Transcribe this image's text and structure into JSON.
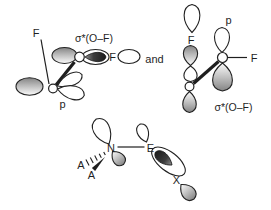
{
  "colors": {
    "background": "#ffffff",
    "ink": "#1f1f1f",
    "lobe_shade_dark": "#848484",
    "lobe_shade_light": "#fbfbfb",
    "dark_lobe": "#1c1c1c"
  },
  "left_structure": {
    "f_top": "F",
    "sigma_star_label": "σ*(O–F)",
    "f_right": "F",
    "p_label": "p"
  },
  "conjunction": "and",
  "right_structure": {
    "f_top": "F",
    "p_label": "p",
    "f_right": "F",
    "sigma_star_label": "σ*(O–F)"
  },
  "bottom_structure": {
    "n": "N",
    "e": "E",
    "a_upper": "A",
    "a_lower": "A",
    "x": "X"
  }
}
